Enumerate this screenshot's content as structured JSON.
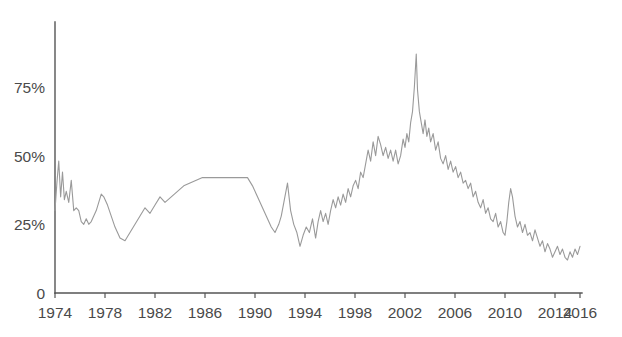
{
  "chart_data": {
    "type": "line",
    "title": "",
    "subtitle": "",
    "xlabel": "",
    "ylabel": "",
    "grid": false,
    "legend": "none",
    "line_color": "#9a9a9a",
    "axis_color": "#555555",
    "label_color": "#4a4a4a",
    "background": "#ffffff",
    "xlim": [
      1974,
      2016
    ],
    "ylim": [
      0,
      95
    ],
    "x_tick_labels": [
      "1974",
      "1978",
      "1982",
      "1986",
      "1990",
      "1994",
      "1998",
      "2002",
      "2006",
      "2010",
      "2014",
      "2016"
    ],
    "x_tick_values": [
      1974,
      1978,
      1982,
      1986,
      1990,
      1994,
      1998,
      2002,
      2006,
      2010,
      2014,
      2016
    ],
    "y_tick_labels": [
      "0",
      "25%",
      "50%",
      "75%"
    ],
    "y_tick_values": [
      0,
      25,
      50,
      75
    ],
    "series": [
      {
        "name": "value",
        "x": [
          1974.0,
          1974.15,
          1974.3,
          1974.45,
          1974.6,
          1974.75,
          1974.9,
          1975.1,
          1975.3,
          1975.5,
          1975.7,
          1975.9,
          1976.1,
          1976.3,
          1976.5,
          1976.7,
          1976.9,
          1977.1,
          1977.3,
          1977.5,
          1977.7,
          1977.9,
          1978.2,
          1978.5,
          1978.8,
          1979.2,
          1979.6,
          1980.0,
          1980.4,
          1980.8,
          1981.2,
          1981.6,
          1982.0,
          1982.4,
          1982.8,
          1983.3,
          1983.8,
          1984.3,
          1984.8,
          1985.3,
          1985.8,
          1986.3,
          1986.8,
          1987.5,
          1988.2,
          1988.9,
          1989.4,
          1989.8,
          1990.2,
          1990.6,
          1991.0,
          1991.3,
          1991.6,
          1991.9,
          1992.1,
          1992.35,
          1992.6,
          1992.85,
          1993.1,
          1993.35,
          1993.6,
          1993.85,
          1994.1,
          1994.35,
          1994.6,
          1994.85,
          1995.05,
          1995.25,
          1995.45,
          1995.65,
          1995.85,
          1996.05,
          1996.25,
          1996.45,
          1996.65,
          1996.85,
          1997.05,
          1997.25,
          1997.45,
          1997.65,
          1997.85,
          1998.05,
          1998.25,
          1998.45,
          1998.65,
          1998.85,
          1999.05,
          1999.25,
          1999.45,
          1999.65,
          1999.85,
          2000.05,
          2000.25,
          2000.45,
          2000.65,
          2000.85,
          2001.05,
          2001.25,
          2001.45,
          2001.65,
          2001.85,
          2002.0,
          2002.15,
          2002.3,
          2002.45,
          2002.6,
          2002.75,
          2002.9,
          2003.0,
          2003.15,
          2003.3,
          2003.45,
          2003.6,
          2003.75,
          2003.9,
          2004.05,
          2004.25,
          2004.45,
          2004.65,
          2004.85,
          2005.05,
          2005.25,
          2005.45,
          2005.65,
          2005.85,
          2006.05,
          2006.25,
          2006.45,
          2006.65,
          2006.85,
          2007.05,
          2007.25,
          2007.45,
          2007.65,
          2007.85,
          2008.05,
          2008.25,
          2008.45,
          2008.65,
          2008.85,
          2009.05,
          2009.25,
          2009.45,
          2009.65,
          2009.85,
          2010.0,
          2010.15,
          2010.3,
          2010.45,
          2010.6,
          2010.8,
          2011.0,
          2011.2,
          2011.4,
          2011.6,
          2011.8,
          2012.0,
          2012.2,
          2012.4,
          2012.6,
          2012.8,
          2013.0,
          2013.2,
          2013.4,
          2013.6,
          2013.8,
          2014.0,
          2014.2,
          2014.4,
          2014.6,
          2014.8,
          2015.0,
          2015.2,
          2015.4,
          2015.6,
          2015.8,
          2016.0
        ],
        "values": [
          30,
          40,
          48,
          35,
          44,
          34,
          37,
          33,
          41,
          30,
          31,
          30,
          26,
          25,
          27,
          25,
          26,
          28,
          30,
          33,
          36,
          35,
          32,
          28,
          24,
          20,
          19,
          22,
          25,
          28,
          31,
          29,
          32,
          35,
          33,
          35,
          37,
          39,
          40,
          41,
          42,
          42,
          42,
          42,
          42,
          42,
          42,
          39,
          35,
          31,
          27,
          24,
          22,
          25,
          28,
          34,
          40,
          30,
          25,
          22,
          17,
          21,
          24,
          22,
          27,
          20,
          26,
          30,
          26,
          29,
          25,
          30,
          34,
          31,
          35,
          32,
          36,
          33,
          38,
          35,
          39,
          41,
          38,
          44,
          42,
          47,
          52,
          48,
          55,
          50,
          57,
          54,
          50,
          53,
          49,
          52,
          48,
          52,
          47,
          50,
          56,
          53,
          58,
          55,
          62,
          66,
          75,
          87,
          74,
          66,
          62,
          58,
          63,
          57,
          60,
          55,
          58,
          52,
          55,
          49,
          47,
          50,
          45,
          48,
          44,
          46,
          42,
          44,
          40,
          41,
          38,
          40,
          35,
          37,
          33,
          31,
          34,
          29,
          31,
          27,
          26,
          29,
          24,
          26,
          22,
          21,
          26,
          33,
          38,
          35,
          28,
          24,
          26,
          22,
          25,
          21,
          22,
          19,
          23,
          20,
          17,
          19,
          15,
          18,
          16,
          13,
          15,
          17,
          14,
          16,
          13,
          12,
          15,
          13,
          16,
          14,
          17
        ]
      }
    ]
  },
  "axes": {
    "plot_left_px": 55,
    "plot_right_px": 580,
    "plot_top_px": 32,
    "plot_bottom_px": 293
  }
}
